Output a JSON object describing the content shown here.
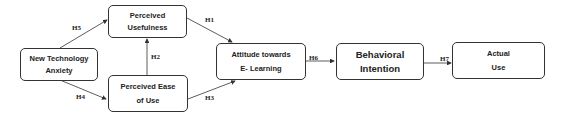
{
  "nodes": {
    "anxiety": {
      "line1": "New Technology",
      "line2": "Anxiety"
    },
    "usefulness": {
      "line1": "Perceived",
      "line2": "Usefulness"
    },
    "ease": {
      "line1": "Perceived Ease",
      "line2": "of Use"
    },
    "attitude": {
      "line1": "Attitude towards",
      "line2": "E- Learning"
    },
    "intention": {
      "line1": "Behavioral",
      "line2": "Intention"
    },
    "use": {
      "line1": "Actual",
      "line2": "Use"
    }
  },
  "edges": {
    "h1": "H1",
    "h2": "H2",
    "h3": "H3",
    "h4": "H4",
    "h5": "H5",
    "h6": "H6",
    "h7": "H7"
  },
  "colors": {
    "stroke": "#333333",
    "text": "#222222"
  }
}
